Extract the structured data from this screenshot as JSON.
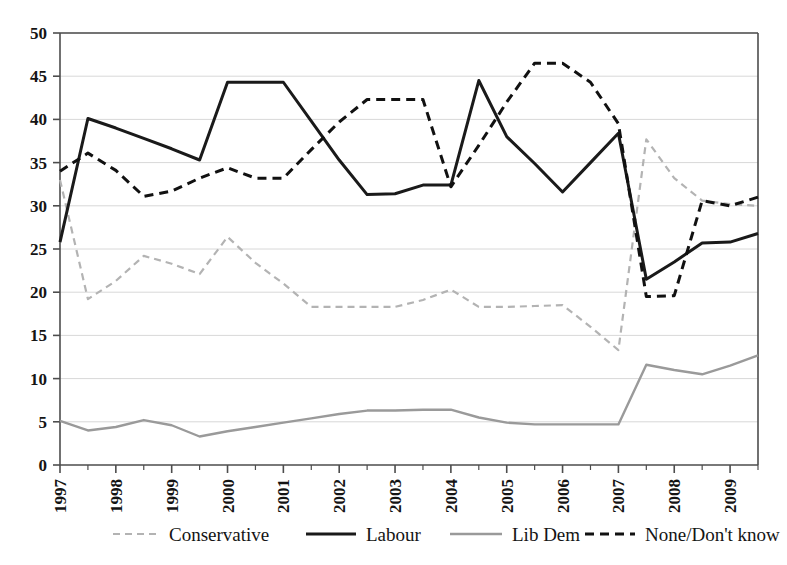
{
  "chart_data": {
    "type": "line",
    "title": "",
    "subtitle": "",
    "xlabel": "",
    "ylabel": "",
    "xlim": [
      1997,
      2009.5
    ],
    "ylim": [
      0,
      50
    ],
    "ytick_step": 5,
    "yticks": [
      0,
      5,
      10,
      15,
      20,
      25,
      30,
      35,
      40,
      45,
      50
    ],
    "ytick_labels": [
      "0",
      "5",
      "10",
      "15",
      "20",
      "25",
      "30",
      "35",
      "40",
      "45",
      "50"
    ],
    "categories": [
      "1997",
      "1997.5",
      "1998",
      "1998.5",
      "1999",
      "1999.5",
      "2000",
      "2000.5",
      "2001",
      "2001.5",
      "2002",
      "2002.5",
      "2003",
      "2003.5",
      "2004",
      "2004.5",
      "2005",
      "2005.5",
      "2006",
      "2006.5",
      "2007",
      "2007.5",
      "2008",
      "2008.5",
      "2009",
      "2009.5"
    ],
    "xtick_labels": [
      "1997",
      "1998",
      "1999",
      "2000",
      "2001",
      "2002",
      "2003",
      "2004",
      "2005",
      "2006",
      "2007",
      "2008",
      "2009"
    ],
    "xtick_rotation": -90,
    "grid": "horizontal",
    "legend_position": "bottom",
    "series": [
      {
        "name": "Conservative",
        "style": "dashed",
        "color": "#b3b3b3",
        "width": 2.2,
        "values": [
          33.0,
          19.2,
          21.3,
          24.2,
          23.3,
          22.1,
          26.4,
          23.4,
          21.0,
          18.3,
          18.3,
          18.3,
          18.3,
          19.1,
          20.3,
          18.3,
          18.3,
          18.4,
          18.5,
          16.0,
          13.3,
          37.7,
          33.2,
          30.6,
          30.2,
          30.0
        ]
      },
      {
        "name": "Labour",
        "style": "solid",
        "color": "#1a1a1a",
        "width": 3.0,
        "values": [
          25.8,
          40.1,
          39.0,
          37.8,
          36.6,
          35.3,
          44.3,
          44.3,
          44.3,
          39.8,
          35.3,
          31.3,
          31.4,
          32.4,
          32.4,
          44.5,
          38.0,
          34.9,
          31.6,
          35.0,
          38.4,
          21.5,
          23.5,
          25.7,
          25.8,
          26.8
        ]
      },
      {
        "name": "Lib Dem",
        "style": "solid",
        "color": "#9a9a9a",
        "width": 2.4,
        "values": [
          5.1,
          4.0,
          4.4,
          5.2,
          4.6,
          3.3,
          3.9,
          4.4,
          4.9,
          5.4,
          5.9,
          6.3,
          6.3,
          6.4,
          6.4,
          5.5,
          4.9,
          4.7,
          4.7,
          4.7,
          4.7,
          11.6,
          11.0,
          10.5,
          11.5,
          12.7
        ]
      },
      {
        "name": "None/Don't know",
        "style": "dashed",
        "color": "#111111",
        "width": 3.0,
        "values": [
          34.0,
          36.1,
          34.1,
          31.1,
          31.7,
          33.2,
          34.4,
          33.2,
          33.2,
          36.5,
          39.7,
          42.3,
          42.3,
          42.3,
          32.2,
          37.0,
          42.0,
          46.5,
          46.5,
          44.3,
          39.5,
          19.5,
          19.6,
          30.6,
          30.0,
          31.0
        ]
      }
    ],
    "legend": [
      {
        "label": "Conservative",
        "style": "dashed",
        "color": "#b3b3b3"
      },
      {
        "label": "Labour",
        "style": "solid",
        "color": "#1a1a1a"
      },
      {
        "label": "Lib Dem",
        "style": "solid",
        "color": "#9a9a9a"
      },
      {
        "label": "None/Don't know",
        "style": "dashed",
        "color": "#111111"
      }
    ],
    "axis_color": "#4d4d4d",
    "grid_color": "#d8d8d8",
    "background": "#ffffff"
  }
}
